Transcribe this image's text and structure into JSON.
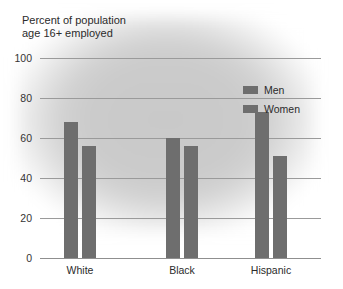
{
  "chart_data": {
    "type": "bar",
    "title_line1": "Percent of population",
    "title_line2": "age 16+ employed",
    "xlabel": "",
    "ylabel": "",
    "ylim": [
      0,
      100
    ],
    "yticks": [
      0,
      20,
      40,
      60,
      80,
      100
    ],
    "ytick_labels": [
      "0",
      "20",
      "40",
      "60",
      "80",
      "100"
    ],
    "grid": true,
    "legend_position": "upper right",
    "categories": [
      "White",
      "Black",
      "Hispanic"
    ],
    "series": [
      {
        "name": "Men",
        "color": "#6e6e6e",
        "values": [
          68,
          60,
          73
        ]
      },
      {
        "name": "Women",
        "color": "#6e6e6e",
        "values": [
          56,
          56,
          51
        ]
      }
    ],
    "colors": {
      "bar": "#6e6e6e",
      "gridline": "#9a9a9a",
      "text": "#2b2b2b",
      "background": "#ffffff",
      "blob": "#c9c9c9"
    }
  }
}
